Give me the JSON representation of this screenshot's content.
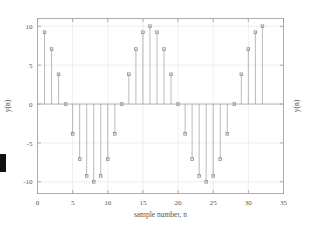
{
  "figure": {
    "background_color": "#ffffff",
    "axes_color": "#9a9a9a",
    "grid_color": "#dcdcdc",
    "stem_color": "#9d9d9d",
    "marker_color": "#8a8a8a",
    "text_color": "#555555"
  },
  "chart_data": {
    "type": "scatter",
    "subtype": "stem",
    "title": "",
    "xlabel": "sample number, n",
    "ylabel": "y(n)",
    "ylabel_right": "y(n)",
    "xlim": [
      0,
      35
    ],
    "ylim": [
      -11.5,
      11.0
    ],
    "grid": true,
    "legend": null,
    "xticks": [
      0,
      5,
      10,
      15,
      20,
      25,
      30,
      35
    ],
    "xtick_labels": [
      "0",
      "5",
      "10",
      "15",
      "20",
      "25",
      "30",
      "35"
    ],
    "yticks": [
      -10,
      -5,
      0,
      5,
      10
    ],
    "ytick_labels": [
      "-10",
      "-5",
      "0",
      "5",
      "10"
    ],
    "x": [
      1,
      2,
      3,
      4,
      5,
      6,
      7,
      8,
      9,
      10,
      11,
      12,
      13,
      14,
      15,
      16,
      17,
      18,
      19,
      20,
      21,
      22,
      23,
      24,
      25,
      26,
      27,
      28,
      29,
      30,
      31,
      32
    ],
    "values": [
      9.24,
      7.07,
      3.83,
      0.0,
      -3.83,
      -7.07,
      -9.24,
      -10.0,
      -9.24,
      -7.07,
      -3.83,
      0.0,
      3.83,
      7.07,
      9.24,
      10.0,
      9.24,
      7.07,
      3.83,
      0.0,
      -3.83,
      -7.07,
      -9.24,
      -10.0,
      -9.24,
      -7.07,
      -3.83,
      0.0,
      3.83,
      7.07,
      9.24,
      10.0
    ],
    "baseline": 0
  },
  "axis_titles": {
    "x": "sample number, n",
    "y_left": "y(n)",
    "y_right": "y(n)"
  }
}
